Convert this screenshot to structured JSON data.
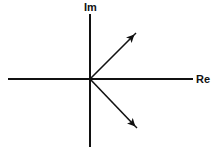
{
  "diagram": {
    "type": "complex-plane",
    "axes": {
      "real_label": "Re",
      "imag_label": "Im"
    },
    "vectors": [
      {
        "name": "upper-root",
        "direction": "upper-right",
        "angle_deg": 45
      },
      {
        "name": "lower-root",
        "direction": "lower-right",
        "angle_deg": -45
      }
    ],
    "colors": {
      "stroke": "#111111",
      "background": "#ffffff"
    }
  }
}
